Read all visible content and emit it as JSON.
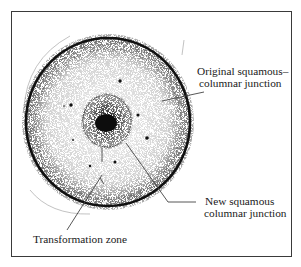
{
  "diagram": {
    "type": "anatomical illustration — cervix (frontal view) showing squamous-columnar junctions",
    "labels": {
      "original_scj": {
        "line1": "Original squamous–",
        "line2": "columnar junction"
      },
      "new_scj": {
        "line1": "New squamous",
        "line2": "columnar junction"
      },
      "transformation_zone": {
        "text": "Transformation zone"
      }
    },
    "colors": {
      "ink": "#111111",
      "stipple": "#333333",
      "leader": "#444444",
      "frame": "#3a3a3a",
      "background": "#ffffff"
    },
    "shapes": {
      "outer_circle": {
        "cx": 108,
        "cy": 122,
        "rx": 82,
        "ry": 84
      },
      "original_scj_ring": {
        "cx": 108,
        "cy": 124,
        "rx": 73,
        "ry": 75
      },
      "new_scj_ring": {
        "cx": 107,
        "cy": 121,
        "r": 24
      },
      "external_os": {
        "cx": 106,
        "cy": 123,
        "rx": 11,
        "ry": 9
      },
      "nabothian_dots": [
        [
          120,
          81
        ],
        [
          71,
          105
        ],
        [
          138,
          115
        ],
        [
          147,
          138
        ],
        [
          73,
          140
        ],
        [
          90,
          166
        ],
        [
          115,
          162
        ],
        [
          64,
          106
        ]
      ]
    }
  }
}
